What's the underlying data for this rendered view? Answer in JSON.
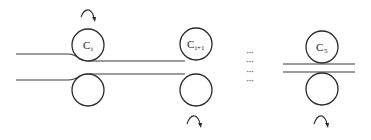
{
  "diagram": {
    "colors": {
      "stroke": "#2a2a2a",
      "background": "#ffffff"
    },
    "stands": [
      {
        "id": "stand-i",
        "label_main": "C",
        "label_sub": "i",
        "rotation_arrow": "top"
      },
      {
        "id": "stand-i-plus-1",
        "label_main": "C",
        "label_sub": "i+1",
        "rotation_arrow": "bottom"
      },
      {
        "id": "stand-5",
        "label_main": "C",
        "label_sub": "5",
        "rotation_arrow": "bottom"
      }
    ],
    "ellipsis": [
      "···",
      "···",
      "···",
      "···"
    ]
  }
}
